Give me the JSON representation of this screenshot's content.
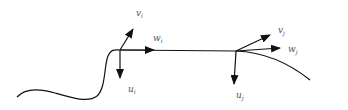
{
  "diagram": {
    "stroke_color": "#111111",
    "label_color": "#555555",
    "frame_i": {
      "v": {
        "base": "v",
        "sub": "i"
      },
      "w": {
        "base": "w",
        "sub": "i"
      },
      "u": {
        "base": "u",
        "sub": "i"
      }
    },
    "frame_j": {
      "v": {
        "base": "v",
        "sub": "j"
      },
      "w": {
        "base": "w",
        "sub": "j"
      },
      "u": {
        "base": "u",
        "sub": "j"
      }
    }
  }
}
